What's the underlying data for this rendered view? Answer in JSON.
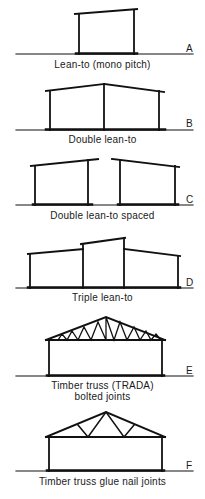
{
  "figure": {
    "panels": [
      {
        "letter": "A",
        "caption": "Lean-to (mono pitch)",
        "caption_line2": ""
      },
      {
        "letter": "B",
        "caption": "Double lean-to",
        "caption_line2": ""
      },
      {
        "letter": "C",
        "caption": "Double lean-to spaced",
        "caption_line2": ""
      },
      {
        "letter": "D",
        "caption": "Triple lean-to",
        "caption_line2": ""
      },
      {
        "letter": "E",
        "caption": "Timber truss (TRADA)",
        "caption_line2": "bolted joints"
      },
      {
        "letter": "F",
        "caption": "Timber truss glue nail joints",
        "caption_line2": ""
      }
    ],
    "colors": {
      "line": "#111111",
      "background": "#ffffff"
    }
  }
}
